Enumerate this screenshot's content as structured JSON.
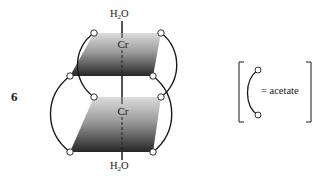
{
  "figure": {
    "compound_number": "6",
    "axial_ligand_top": {
      "main": "H",
      "sub": "2",
      "tail": "O"
    },
    "axial_ligand_bottom": {
      "main": "H",
      "sub": "2",
      "tail": "O"
    },
    "metal_top": "Cr",
    "metal_bottom": "Cr",
    "bridging_ligand_count": 4
  },
  "legend": {
    "equals_text": "= acetate",
    "symbol": "arc-with-two-oxygen-circles"
  },
  "colors": {
    "ink": "#1a1a1a",
    "plane_light": "#d9d9d9",
    "plane_dark": "#2a2a2a",
    "atom_fill": "#ffffff"
  }
}
